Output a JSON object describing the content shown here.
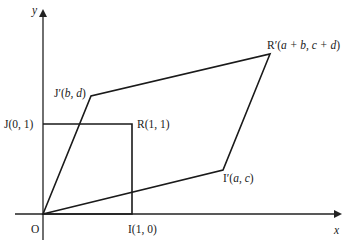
{
  "figure": {
    "axes": {
      "x_label": "x",
      "y_label": "y"
    },
    "colors": {
      "line": "#1a1a1a",
      "background": "#ffffff"
    },
    "unit_square": {
      "points": [
        {
          "name": "O",
          "label": "O",
          "coords": "(0, 0)"
        },
        {
          "name": "I",
          "label": "I(1, 0)"
        },
        {
          "name": "R",
          "label": "R(1, 1)"
        },
        {
          "name": "J",
          "label": "J(0, 1)"
        }
      ]
    },
    "parallelogram": {
      "points": [
        {
          "name": "O",
          "label": "O"
        },
        {
          "name": "I'",
          "label_prefix": "I′(",
          "vars": "a, c",
          "label_suffix": ")"
        },
        {
          "name": "R'",
          "label_prefix": "R′(",
          "vars": "a + b, c + d",
          "label_suffix": ")"
        },
        {
          "name": "J'",
          "label_prefix": "J′(",
          "vars": "b, d",
          "label_suffix": ")"
        }
      ]
    }
  }
}
